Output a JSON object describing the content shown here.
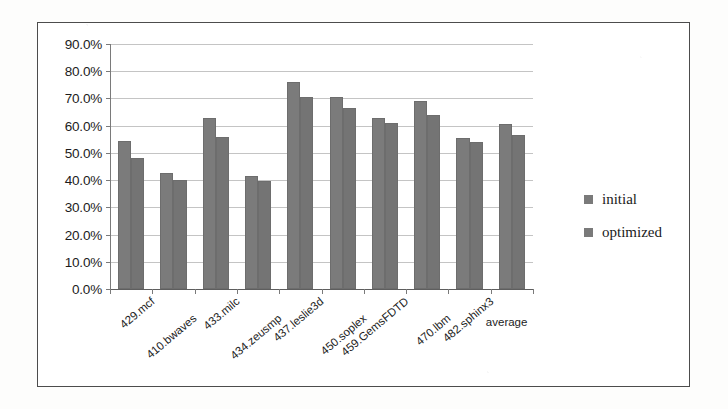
{
  "chart_data": {
    "type": "bar",
    "title": "",
    "xlabel": "",
    "ylabel": "",
    "ylim": [
      0,
      0.9
    ],
    "grid": true,
    "legend_position": "right",
    "ytick_labels": [
      "90.0%",
      "80.0%",
      "70.0%",
      "60.0%",
      "50.0%",
      "40.0%",
      "30.0%",
      "20.0%",
      "10.0%",
      "0.0%"
    ],
    "ytick_values": [
      0.9,
      0.8,
      0.7,
      0.6,
      0.5,
      0.4,
      0.3,
      0.2,
      0.1,
      0.0
    ],
    "categories": [
      "429.mcf",
      "410.bwaves",
      "433.milc",
      "434.zeusmp",
      "437.leslie3d",
      "450.soplex",
      "459.GemsFDTD",
      "470.lbm",
      "482.sphinx3",
      "average"
    ],
    "series": [
      {
        "name": "initial",
        "color": "#7b7b7b",
        "values": [
          0.545,
          0.425,
          0.63,
          0.415,
          0.76,
          0.705,
          0.63,
          0.69,
          0.555,
          0.605
        ]
      },
      {
        "name": "optimized",
        "color": "#747474",
        "values": [
          0.48,
          0.4,
          0.56,
          0.395,
          0.705,
          0.665,
          0.61,
          0.64,
          0.54,
          0.565
        ]
      }
    ]
  },
  "legend": {
    "entries": [
      {
        "label": "initial"
      },
      {
        "label": "optimized"
      }
    ]
  },
  "colors": {
    "bar_initial": "#7b7b7b",
    "bar_optimized": "#747474",
    "gridline": "#c4c4c4",
    "axis": "#5e5e5e",
    "frame_border": "#4c4c4c",
    "text": "#1c1c1c"
  }
}
